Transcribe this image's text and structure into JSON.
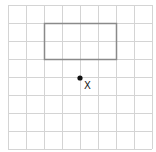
{
  "diagram": {
    "type": "grid-with-rectangle-and-point",
    "grid": {
      "origin_x": 8,
      "origin_y": 5,
      "cell_size": 18,
      "columns": 8,
      "rows": 8,
      "line_color": "#d4d4d4"
    },
    "rectangle": {
      "col": 2,
      "row": 1,
      "width_cells": 4,
      "height_cells": 2,
      "stroke_color": "#8a8a8a"
    },
    "point": {
      "col": 4,
      "row": 4,
      "color": "#111111",
      "label": "X"
    }
  }
}
